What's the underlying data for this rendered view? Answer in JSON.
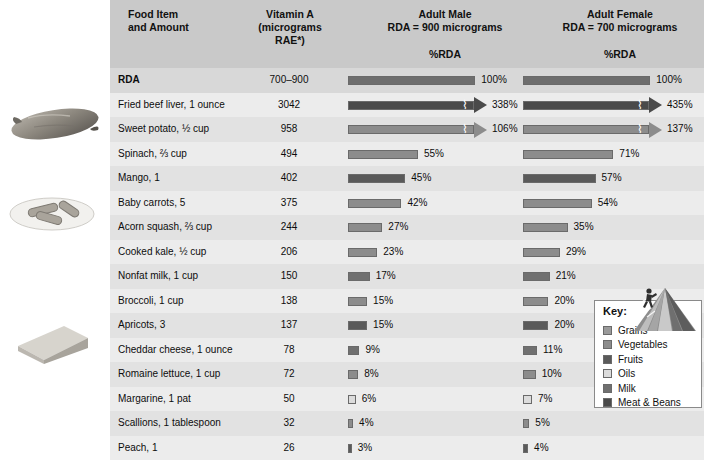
{
  "header": {
    "food_col_line1": "Food Item",
    "food_col_line2": "and Amount",
    "vitamin_line1": "Vitamin A",
    "vitamin_line2": "(micrograms",
    "vitamin_line3": "RAE*)",
    "male_line1": "Adult Male",
    "male_line2": "RDA = 900 micrograms",
    "female_line1": "Adult Female",
    "female_line2": "RDA = 700 micrograms",
    "male_sub": "%RDA",
    "female_sub": "%RDA"
  },
  "legend": {
    "title": "Key:",
    "items": [
      {
        "label": "Grains",
        "color": "#9a9a9a"
      },
      {
        "label": "Vegetables",
        "color": "#8c8c8c"
      },
      {
        "label": "Fruits",
        "color": "#5a5a5a"
      },
      {
        "label": "Oils",
        "color": "#dcdcdc"
      },
      {
        "label": "Milk",
        "color": "#707070"
      },
      {
        "label": "Meat & Beans",
        "color": "#4a4a4a"
      }
    ]
  },
  "icons": {
    "pyramid": "mypyramid-icon",
    "photo_sweet_potato": "sweet-potato-photo",
    "photo_mango": "mango-photo",
    "photo_cheese": "cheese-wedge-photo"
  },
  "chart_data": {
    "type": "bar",
    "xlabel": "%RDA",
    "ylabel": "Food Item and Amount",
    "columns": [
      "Food Item and Amount",
      "Vitamin A (micrograms RAE*)",
      "Adult Male %RDA",
      "Adult Female %RDA"
    ],
    "male_rda": 900,
    "female_rda": 700,
    "axis_max_percent": 110,
    "grid": false,
    "legend_position": "bottom-right",
    "rows": [
      {
        "name": "RDA",
        "bold": true,
        "amount": "700–900",
        "male_pct": 100,
        "female_pct": 100,
        "male_label": "100%",
        "female_label": "100%",
        "category": "rda",
        "color": "#6e6e6e",
        "broken": false
      },
      {
        "name": "Fried beef liver, 1 ounce",
        "bold": false,
        "amount": "3042",
        "male_pct": 338,
        "female_pct": 435,
        "male_label": "338%",
        "female_label": "435%",
        "category": "Meat & Beans",
        "color": "#4a4a4a",
        "broken": true
      },
      {
        "name": "Sweet potato, ½ cup",
        "bold": false,
        "amount": "958",
        "male_pct": 106,
        "female_pct": 137,
        "male_label": "106%",
        "female_label": "137%",
        "category": "Vegetables",
        "color": "#8c8c8c",
        "broken": true
      },
      {
        "name": "Spinach, ⅔ cup",
        "bold": false,
        "amount": "494",
        "male_pct": 55,
        "female_pct": 71,
        "male_label": "55%",
        "female_label": "71%",
        "category": "Vegetables",
        "color": "#8c8c8c",
        "broken": false
      },
      {
        "name": "Mango, 1",
        "bold": false,
        "amount": "402",
        "male_pct": 45,
        "female_pct": 57,
        "male_label": "45%",
        "female_label": "57%",
        "category": "Fruits",
        "color": "#5a5a5a",
        "broken": false
      },
      {
        "name": "Baby carrots, 5",
        "bold": false,
        "amount": "375",
        "male_pct": 42,
        "female_pct": 54,
        "male_label": "42%",
        "female_label": "54%",
        "category": "Vegetables",
        "color": "#8c8c8c",
        "broken": false
      },
      {
        "name": "Acorn squash, ⅔ cup",
        "bold": false,
        "amount": "244",
        "male_pct": 27,
        "female_pct": 35,
        "male_label": "27%",
        "female_label": "35%",
        "category": "Vegetables",
        "color": "#8c8c8c",
        "broken": false
      },
      {
        "name": "Cooked kale, ½ cup",
        "bold": false,
        "amount": "206",
        "male_pct": 23,
        "female_pct": 29,
        "male_label": "23%",
        "female_label": "29%",
        "category": "Vegetables",
        "color": "#8c8c8c",
        "broken": false
      },
      {
        "name": "Nonfat milk, 1 cup",
        "bold": false,
        "amount": "150",
        "male_pct": 17,
        "female_pct": 21,
        "male_label": "17%",
        "female_label": "21%",
        "category": "Milk",
        "color": "#707070",
        "broken": false
      },
      {
        "name": "Broccoli, 1 cup",
        "bold": false,
        "amount": "138",
        "male_pct": 15,
        "female_pct": 20,
        "male_label": "15%",
        "female_label": "20%",
        "category": "Vegetables",
        "color": "#8c8c8c",
        "broken": false
      },
      {
        "name": "Apricots, 3",
        "bold": false,
        "amount": "137",
        "male_pct": 15,
        "female_pct": 20,
        "male_label": "15%",
        "female_label": "20%",
        "category": "Fruits",
        "color": "#5a5a5a",
        "broken": false
      },
      {
        "name": "Cheddar cheese, 1 ounce",
        "bold": false,
        "amount": "78",
        "male_pct": 9,
        "female_pct": 11,
        "male_label": "9%",
        "female_label": "11%",
        "category": "Milk",
        "color": "#707070",
        "broken": false
      },
      {
        "name": "Romaine lettuce, 1 cup",
        "bold": false,
        "amount": "72",
        "male_pct": 8,
        "female_pct": 10,
        "male_label": "8%",
        "female_label": "10%",
        "category": "Vegetables",
        "color": "#8c8c8c",
        "broken": false
      },
      {
        "name": "Margarine, 1 pat",
        "bold": false,
        "amount": "50",
        "male_pct": 6,
        "female_pct": 7,
        "male_label": "6%",
        "female_label": "7%",
        "category": "Oils",
        "color": "#dcdcdc",
        "broken": false
      },
      {
        "name": "Scallions, 1 tablespoon",
        "bold": false,
        "amount": "32",
        "male_pct": 4,
        "female_pct": 5,
        "male_label": "4%",
        "female_label": "5%",
        "category": "Vegetables",
        "color": "#8c8c8c",
        "broken": false
      },
      {
        "name": "Peach, 1",
        "bold": false,
        "amount": "26",
        "male_pct": 3,
        "female_pct": 4,
        "male_label": "3%",
        "female_label": "4%",
        "category": "Fruits",
        "color": "#5a5a5a",
        "broken": false
      }
    ]
  }
}
